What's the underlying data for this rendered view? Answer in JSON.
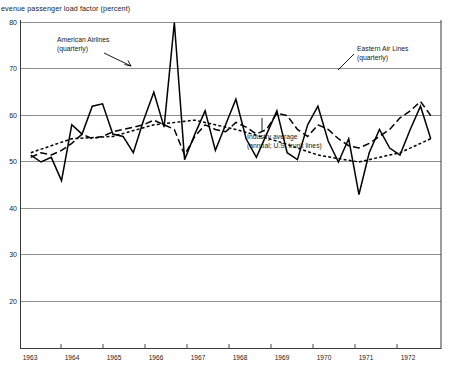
{
  "chart_data": {
    "type": "line",
    "title": "evenue passenger load factor (percent)",
    "xlabel": "",
    "ylabel": "",
    "grid": true,
    "legend_position": "inline-annotations",
    "xlim": [
      1962.75,
      1973.0
    ],
    "ylim": [
      20,
      80
    ],
    "yticks": [
      "80",
      "70",
      "60",
      "50",
      "40",
      "30",
      "20"
    ],
    "xticks": [
      "1963",
      "1964",
      "1965",
      "1966",
      "1967",
      "1968",
      "1969",
      "1970",
      "1971",
      "1972"
    ],
    "annotations": [
      {
        "name": "american-airlines",
        "line1": "American Airlines",
        "line2": "(quarterly)"
      },
      {
        "name": "eastern-air-lines",
        "line1": "Eastern Air Lines",
        "line2": "(quarterly)"
      },
      {
        "name": "industry-average",
        "line1": "Industry average",
        "line2": "(annual; U.S. trunk lines)"
      }
    ],
    "series": [
      {
        "name": "American Airlines (quarterly)",
        "style": "solid",
        "x": [
          1963.0,
          1963.25,
          1963.5,
          1963.75,
          1964.0,
          1964.25,
          1964.5,
          1964.75,
          1965.0,
          1965.25,
          1965.5,
          1965.75,
          1966.0,
          1966.25,
          1966.5,
          1966.75,
          1967.0,
          1967.25,
          1967.5,
          1967.75,
          1968.0,
          1968.25,
          1968.5,
          1968.75,
          1969.0,
          1969.25,
          1969.5,
          1969.75,
          1970.0,
          1970.25,
          1970.5,
          1970.75,
          1971.0,
          1971.25,
          1971.5,
          1971.75,
          1972.0,
          1972.25,
          1972.5,
          1972.75
        ],
        "values": [
          51.5,
          50.0,
          51.0,
          46.0,
          58.0,
          56.0,
          62.0,
          62.5,
          56.0,
          55.5,
          52.0,
          59.0,
          65.0,
          57.5,
          80.0,
          50.5,
          56.0,
          61.0,
          52.5,
          58.0,
          63.5,
          55.0,
          51.0,
          56.0,
          61.0,
          52.0,
          50.5,
          58.0,
          62.0,
          54.5,
          50.0,
          55.0,
          43.0,
          52.0,
          57.0,
          53.0,
          51.5,
          57.0,
          62.0,
          55.0
        ]
      },
      {
        "name": "Eastern Air Lines (quarterly)",
        "style": "long-dash",
        "x": [
          1963.0,
          1963.25,
          1963.5,
          1963.75,
          1964.0,
          1964.25,
          1964.5,
          1964.75,
          1965.0,
          1965.25,
          1965.5,
          1965.75,
          1966.0,
          1966.25,
          1966.5,
          1966.75,
          1967.0,
          1967.25,
          1967.5,
          1967.75,
          1968.0,
          1968.25,
          1968.5,
          1968.75,
          1969.0,
          1969.25,
          1969.5,
          1969.75,
          1970.0,
          1970.25,
          1970.5,
          1970.75,
          1971.0,
          1971.25,
          1971.5,
          1971.75,
          1972.0,
          1972.25,
          1972.5,
          1972.75
        ],
        "values": [
          51.0,
          52.0,
          51.5,
          52.5,
          54.0,
          56.0,
          55.0,
          55.5,
          56.5,
          57.0,
          57.5,
          58.0,
          59.0,
          58.0,
          57.0,
          51.5,
          55.5,
          58.0,
          57.0,
          56.5,
          58.5,
          57.5,
          56.0,
          57.0,
          60.5,
          60.0,
          57.0,
          55.5,
          58.0,
          57.0,
          55.0,
          53.5,
          53.0,
          54.0,
          55.5,
          57.0,
          59.5,
          61.0,
          63.0,
          60.0
        ]
      },
      {
        "name": "Industry average (annual; U.S. trunk lines)",
        "style": "short-dot",
        "x": [
          1963.0,
          1964.0,
          1965.0,
          1966.0,
          1967.0,
          1968.0,
          1969.0,
          1970.0,
          1971.0,
          1972.0,
          1972.75
        ],
        "values": [
          52.0,
          55.0,
          55.5,
          58.0,
          59.0,
          57.0,
          54.5,
          51.5,
          50.0,
          52.0,
          55.0
        ]
      }
    ]
  }
}
